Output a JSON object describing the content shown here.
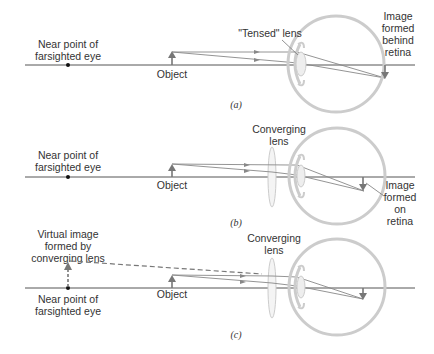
{
  "figure": {
    "panels": [
      {
        "id": "a",
        "caption": "(a)",
        "labels": {
          "near_point_line1": "Near point of",
          "near_point_line2": "farsighted eye",
          "object": "Object",
          "lens": "\"Tensed\" lens",
          "image_line1": "Image",
          "image_line2": "formed",
          "image_line3": "behind",
          "image_line4": "retina"
        }
      },
      {
        "id": "b",
        "caption": "(b)",
        "labels": {
          "near_point_line1": "Near point of",
          "near_point_line2": "farsighted eye",
          "object": "Object",
          "lens_line1": "Converging",
          "lens_line2": "lens",
          "image_line1": "Image",
          "image_line2": "formed",
          "image_line3": "on",
          "image_line4": "retina"
        }
      },
      {
        "id": "c",
        "caption": "(c)",
        "labels": {
          "virtual_line1": "Virtual image",
          "virtual_line2": "formed by",
          "virtual_line3": "converging lens",
          "near_point_line1": "Near point of",
          "near_point_line2": "farsighted eye",
          "object": "Object",
          "lens_line1": "Converging",
          "lens_line2": "lens"
        }
      }
    ],
    "colors": {
      "axis": "#555555",
      "ray": "#777777",
      "eye": "#c8c8c8",
      "arrow": "#777777",
      "text": "#333333"
    }
  }
}
